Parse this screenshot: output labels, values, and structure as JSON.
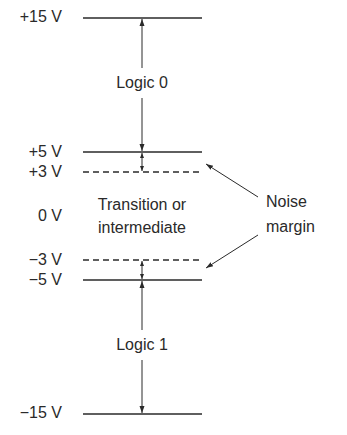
{
  "diagram": {
    "levels": [
      {
        "label": "+15 V",
        "value": 15,
        "style": "solid"
      },
      {
        "label": "+5 V",
        "value": 5,
        "style": "solid"
      },
      {
        "label": "+3 V",
        "value": 3,
        "style": "dashed"
      },
      {
        "label": "0 V",
        "value": 0,
        "style": "none"
      },
      {
        "label": "−3 V",
        "value": -3,
        "style": "dashed"
      },
      {
        "label": "−5 V",
        "value": -5,
        "style": "solid"
      },
      {
        "label": "−15 V",
        "value": -15,
        "style": "solid"
      }
    ],
    "regions": {
      "logic0": "Logic 0",
      "transition_line1": "Transition or",
      "transition_line2": "intermediate",
      "logic1": "Logic 1"
    },
    "callout": {
      "line1": "Noise",
      "line2": "margin"
    },
    "colors": {
      "line": "#2a2a2a",
      "text": "#2a2a2a",
      "background": "#ffffff"
    }
  }
}
